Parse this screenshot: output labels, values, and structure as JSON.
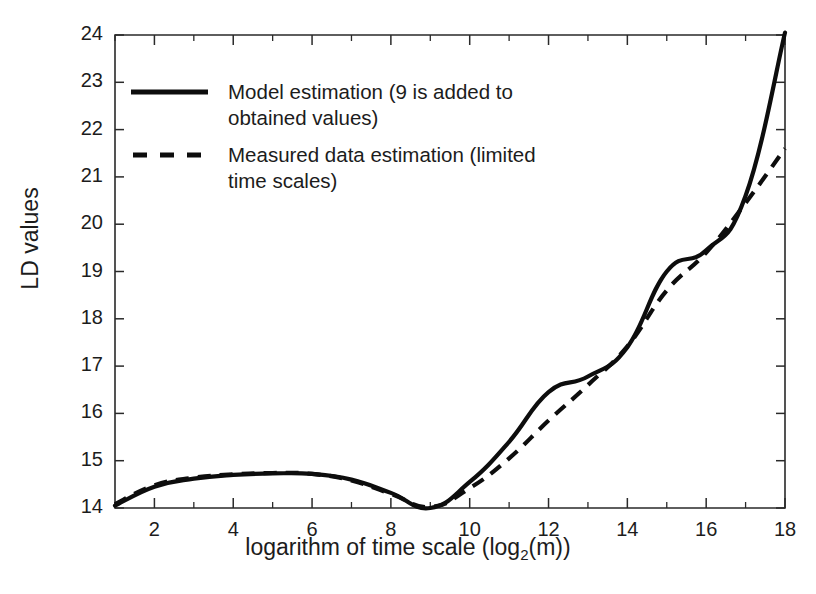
{
  "chart_data": {
    "type": "line",
    "title": "",
    "xlabel": "logarithm of time scale  (log2(m))",
    "xlabel_main": "logarithm of time scale  (log",
    "xlabel_sub": "2",
    "xlabel_tail": "(m))",
    "ylabel": "LD values",
    "xlim": [
      1,
      18
    ],
    "ylim": [
      14,
      24
    ],
    "grid": false,
    "legend_position": "upper-left-inside",
    "x_ticks": [
      2,
      4,
      6,
      8,
      10,
      12,
      14,
      16,
      18
    ],
    "x_ticks_minor": [
      1,
      3,
      5,
      7,
      9,
      11,
      13,
      15,
      17
    ],
    "y_ticks": [
      14,
      15,
      16,
      17,
      18,
      19,
      20,
      21,
      22,
      23,
      24
    ],
    "x": [
      1,
      2,
      3,
      4,
      5,
      6,
      7,
      8,
      9,
      10,
      11,
      12,
      13,
      14,
      15,
      16,
      17,
      18
    ],
    "series": [
      {
        "name": "Model estimation (9 is added to obtained values)",
        "style": "solid",
        "color": "#0d0d0d",
        "values": [
          14.05,
          14.45,
          14.62,
          14.7,
          14.73,
          14.72,
          14.6,
          14.32,
          14.0,
          14.55,
          15.4,
          16.45,
          16.78,
          17.4,
          19.0,
          19.45,
          20.6,
          24.05
        ]
      },
      {
        "name": "Measured data estimation (limited time scales)",
        "style": "dashed",
        "color": "#0d0d0d",
        "values": [
          14.08,
          14.48,
          14.64,
          14.71,
          14.74,
          14.72,
          14.58,
          14.3,
          14.02,
          14.42,
          15.05,
          15.85,
          16.6,
          17.42,
          18.6,
          19.4,
          20.45,
          21.6
        ]
      }
    ]
  },
  "legend": {
    "entries": [
      {
        "label": "Model estimation (9 is added to\nobtained values)",
        "style": "solid"
      },
      {
        "label": "Measured data estimation (limited\ntime scales)",
        "style": "dashed"
      }
    ]
  },
  "axes": {
    "y_title": "LD values",
    "x_title_main": "logarithm of time scale  (log",
    "x_title_sub": "2",
    "x_title_tail": "(m))"
  },
  "colors": {
    "line": "#0d0d0d",
    "axis": "#2a2a2a",
    "background": "#ffffff"
  }
}
